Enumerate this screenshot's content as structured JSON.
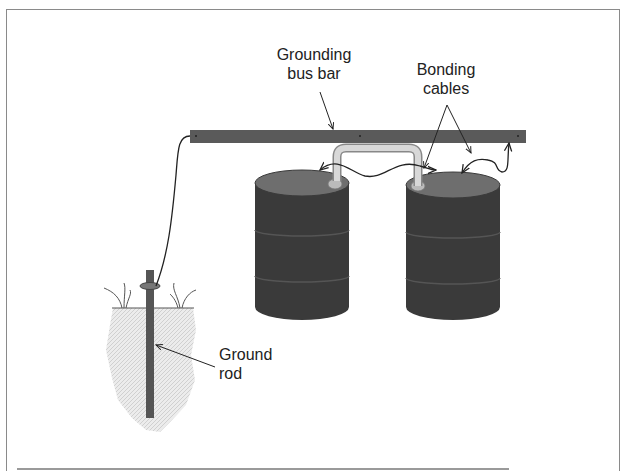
{
  "labels": {
    "bus_bar_line1": "Grounding",
    "bus_bar_line2": "bus bar",
    "bonding_line1": "Bonding",
    "bonding_line2": "cables",
    "rod_line1": "Ground",
    "rod_line2": "rod"
  },
  "colors": {
    "bus_bar": "#5a5a5a",
    "drum_body": "#3a3a3a",
    "drum_top": "#6e6e6e",
    "soil": "#e4e4e4",
    "rod": "#555555",
    "cable": "#222222",
    "frame": "#8a8a8a",
    "pipe": "#c8c8c8"
  },
  "components": [
    "grounding bus bar",
    "two metal drums",
    "bonding cables",
    "transfer pipe",
    "ground rod",
    "soil"
  ]
}
